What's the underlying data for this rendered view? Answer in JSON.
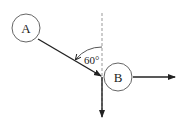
{
  "diagram": {
    "nodes": [
      {
        "id": "A",
        "label": "A",
        "cx": 26,
        "cy": 28,
        "r": 14
      },
      {
        "id": "B",
        "label": "B",
        "cx": 118,
        "cy": 77,
        "r": 14
      }
    ],
    "angle_label": "60°",
    "colors": {
      "stroke": "#222222",
      "dashed": "#999999",
      "circle": "#666666"
    }
  }
}
